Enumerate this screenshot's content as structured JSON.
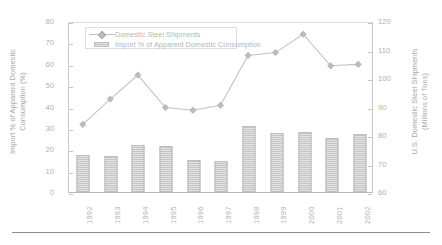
{
  "chart_data": {
    "type": "bar",
    "title": "",
    "subtitle": "",
    "categories": [
      "1992",
      "1993",
      "1994",
      "1995",
      "1996",
      "1997",
      "1998",
      "1999",
      "2000",
      "2001",
      "2002"
    ],
    "xlabel": "",
    "grid": false,
    "legend_position": "top-left",
    "axes": {
      "left": {
        "label": "Import % of Apparent Domestic\nConsumption (%)",
        "ticks": [
          0,
          10,
          20,
          30,
          40,
          50,
          60,
          70,
          80
        ],
        "ylim": [
          0,
          80
        ]
      },
      "right": {
        "label": "U.S. Domestic Steel Shipments\n(Millions of Tons)",
        "ticks": [
          60,
          70,
          80,
          90,
          100,
          110,
          120
        ],
        "ylim": [
          60,
          120
        ]
      }
    },
    "series": [
      {
        "name": "Domestic Steel Shipments",
        "type": "line",
        "marker": "diamond",
        "axis": "right",
        "unit": "Millions of Tons",
        "color": "#c2c2c2",
        "values": [
          84.0,
          93.0,
          101.5,
          90.0,
          89.0,
          90.8,
          108.5,
          109.5,
          116.0,
          104.8,
          105.3
        ]
      },
      {
        "name": "Import % of Apparent Domestic Consumption",
        "type": "bar",
        "axis": "left",
        "unit": "%",
        "color": "#c4c4c4",
        "values": [
          17.3,
          17.0,
          22.0,
          21.5,
          14.8,
          14.7,
          31.0,
          27.5,
          28.0,
          25.5,
          27.0
        ]
      }
    ]
  },
  "legend": {
    "entries": [
      {
        "label": "Domestic Steel Shipments",
        "key": "line-diamond-marker"
      },
      {
        "label": "Import % of Apparent Domestic Consumption",
        "key": "bar-swatch"
      }
    ]
  },
  "axis_titles": {
    "left": "Import % of Apparent Domestic\nConsumption (%)",
    "right": "U.S.  Domestic Steel Shipments\n(Millions of Tons)"
  }
}
